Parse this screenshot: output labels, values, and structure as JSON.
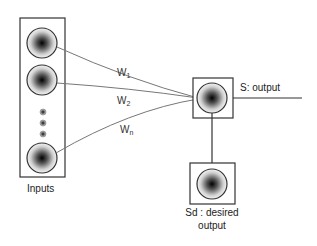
{
  "diagram": {
    "type": "single-layer perceptron / neuron",
    "inputs_label": "Inputs",
    "weights": [
      {
        "name": "W",
        "sub": "1"
      },
      {
        "name": "W",
        "sub": "2"
      },
      {
        "name": "W",
        "sub": "n"
      }
    ],
    "output_label": "S: output",
    "desired_label_line1": "Sd : desired",
    "desired_label_line2": "output"
  }
}
